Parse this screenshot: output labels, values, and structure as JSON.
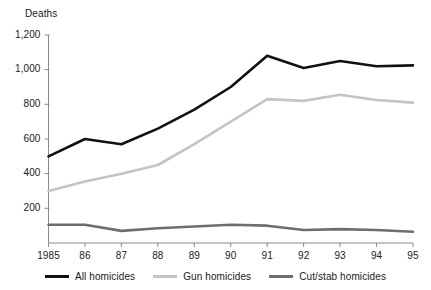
{
  "chart_data": {
    "type": "line",
    "title": "",
    "xlabel": "",
    "ylabel": "Deaths",
    "ylim": [
      0,
      1200
    ],
    "ytick_values": [
      0,
      200,
      400,
      600,
      800,
      1000,
      1200
    ],
    "ytick_labels": [
      "",
      "200",
      "400",
      "600",
      "800",
      "1,000",
      "1,200"
    ],
    "grid": false,
    "legend_position": "bottom",
    "categories": [
      "1985",
      "86",
      "87",
      "88",
      "89",
      "90",
      "91",
      "92",
      "93",
      "94",
      "95"
    ],
    "x_values": [
      1985,
      1986,
      1987,
      1988,
      1989,
      1990,
      1991,
      1992,
      1993,
      1994,
      1995
    ],
    "series": [
      {
        "name": "All homicides",
        "color": "#111111",
        "width": 2.6,
        "values": [
          500,
          600,
          570,
          660,
          770,
          900,
          1080,
          1010,
          1050,
          1020,
          1025
        ]
      },
      {
        "name": "Gun homicides",
        "color": "#c4c4c4",
        "width": 2.6,
        "values": [
          300,
          355,
          400,
          450,
          570,
          700,
          830,
          820,
          855,
          825,
          810
        ]
      },
      {
        "name": "Cut/stab homicides",
        "color": "#6e6e6e",
        "width": 2.6,
        "values": [
          105,
          105,
          70,
          85,
          95,
          105,
          100,
          75,
          80,
          75,
          65
        ]
      }
    ]
  },
  "axis": {
    "ylabel": "Deaths",
    "line_color": "#8a8a8a"
  },
  "legend": {
    "items": [
      {
        "label": "All homicides",
        "color": "#111111"
      },
      {
        "label": "Gun homicides",
        "color": "#c4c4c4"
      },
      {
        "label": "Cut/stab homicides",
        "color": "#6e6e6e"
      }
    ]
  }
}
